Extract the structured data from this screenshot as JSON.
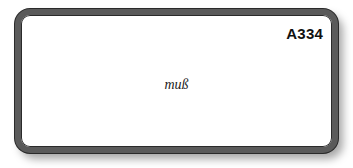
{
  "card": {
    "code": "A334",
    "word": "muß"
  },
  "colors": {
    "border": "#5a5a5a",
    "border_outline": "#2a2a2a",
    "background": "#ffffff",
    "text": "#111111"
  }
}
